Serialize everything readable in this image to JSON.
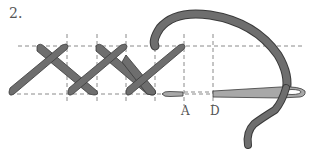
{
  "diagram": {
    "step_number": "2.",
    "point_labels": [
      "A",
      "D"
    ],
    "colors": {
      "thread": "#6e6e6e",
      "thread_outline": "#3a3a3a",
      "needle": "#a8a8a8",
      "guide_lines": "#8a8a8a",
      "background": "#ffffff"
    },
    "elements": [
      "horizontal-guide-top",
      "horizontal-guide-bottom",
      "vertical-guides",
      "cross-stitch-1",
      "cross-stitch-2",
      "partial-stitch-3",
      "thread-loop",
      "needle",
      "thread-tail"
    ]
  }
}
